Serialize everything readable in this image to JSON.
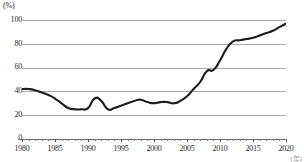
{
  "chart_data": {
    "type": "line",
    "title": "",
    "xlabel": "(年)",
    "ylabel": "(%)",
    "ylim": [
      0,
      100
    ],
    "xlim": [
      1980,
      2020
    ],
    "grid": true,
    "legend": "none",
    "ytick_labels": [
      "100",
      "80",
      "60",
      "40",
      "20",
      "0"
    ],
    "ytick_values": [
      100,
      80,
      60,
      40,
      20,
      0
    ],
    "xtick_labels": [
      "1980",
      "1985",
      "1990",
      "1995",
      "2000",
      "2005",
      "2010",
      "2015",
      "2020"
    ],
    "xtick_values": [
      1980,
      1985,
      1990,
      1995,
      2000,
      2005,
      2010,
      2015,
      2020
    ],
    "x": [
      1980,
      1981,
      1982,
      1983,
      1984,
      1985,
      1986,
      1987,
      1988,
      1989,
      1990,
      1991,
      1992,
      1993,
      1994,
      1995,
      1996,
      1997,
      1998,
      1999,
      2000,
      2001,
      2002,
      2003,
      2004,
      2005,
      2006,
      2007,
      2008,
      2009,
      2010,
      2011,
      2012,
      2013,
      2014,
      2015,
      2016,
      2017,
      2018,
      2019,
      2020
    ],
    "values": [
      42,
      42,
      41,
      39,
      37,
      34,
      30,
      26,
      25,
      25,
      26,
      34,
      32,
      25,
      26,
      28,
      30,
      32,
      33,
      31,
      30,
      31,
      31,
      30,
      32,
      36,
      42,
      48,
      57,
      58,
      66,
      76,
      82,
      83,
      84,
      85,
      87,
      89,
      91,
      94,
      97
    ],
    "series": [
      {
        "name": "series-1",
        "color": "#1c1c1c",
        "values": [
          42,
          42,
          41,
          39,
          37,
          34,
          30,
          26,
          25,
          25,
          26,
          34,
          32,
          25,
          26,
          28,
          30,
          32,
          33,
          31,
          30,
          31,
          31,
          30,
          32,
          36,
          42,
          48,
          57,
          58,
          66,
          76,
          82,
          83,
          84,
          85,
          87,
          89,
          91,
          94,
          97
        ]
      }
    ],
    "annotations": []
  },
  "axes": {
    "y_unit": "(%)",
    "x_unit": "(年)"
  }
}
